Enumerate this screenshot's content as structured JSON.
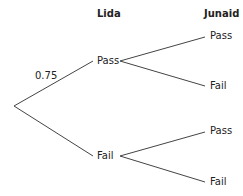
{
  "headers": {
    "first": "Lida",
    "second": "Junaid"
  },
  "probability_label": "0.75",
  "first_level": {
    "upper": "Pass",
    "lower": "Fail"
  },
  "second_level": {
    "upper_upper": "Pass",
    "upper_lower": "Fail",
    "lower_upper": "Pass",
    "lower_lower": "Fail"
  }
}
